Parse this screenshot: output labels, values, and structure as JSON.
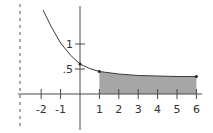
{
  "chart_data": {
    "type": "line",
    "title": "",
    "xlabel": "",
    "ylabel": "",
    "xlim": [
      -2.5,
      6.3
    ],
    "ylim": [
      -0.9,
      1.7
    ],
    "grid": false,
    "x_ticks": [
      -2,
      -1,
      1,
      2,
      3,
      4,
      5,
      6
    ],
    "x_tick_labels": [
      "-2",
      "-1",
      "1",
      "2",
      "3",
      "4",
      "5",
      "6"
    ],
    "y_ticks": [
      0.5,
      1
    ],
    "y_tick_labels": [
      ".5",
      "1"
    ],
    "asymptote_dashed_x": -2.5,
    "series": [
      {
        "name": "decaying curve",
        "x": [
          -1.9,
          -1.5,
          -1,
          -0.5,
          0,
          0.5,
          1,
          2,
          3,
          4,
          5,
          6
        ],
        "y": [
          1.68,
          1.36,
          1.02,
          0.78,
          0.6,
          0.51,
          0.45,
          0.4,
          0.37,
          0.36,
          0.35,
          0.35
        ]
      }
    ],
    "shaded_region": {
      "x_from": 1,
      "x_to": 6,
      "color": "#a6a6a6"
    },
    "marked_points": [
      {
        "x": 0,
        "y": 0.6
      },
      {
        "x": 1,
        "y": 0.45
      },
      {
        "x": 6,
        "y": 0.35
      }
    ]
  },
  "colors": {
    "axis": "#4a4a4a",
    "curve": "#3a3a3a",
    "shade": "#a6a6a6",
    "text": "#333333"
  }
}
